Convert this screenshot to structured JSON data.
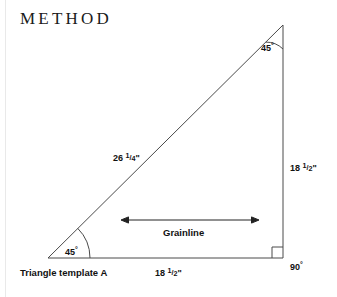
{
  "page": {
    "heading": "METHOD",
    "background_color": "#ffffff",
    "ink_color": "#111111",
    "line_color": "#4a4a4a"
  },
  "figure": {
    "name": "right-triangle-template-diagram",
    "shape": "right triangle",
    "vertices": {
      "apex_top_right": [
        283,
        25
      ],
      "corner_bottom_left": [
        48,
        258
      ],
      "corner_bottom_right": [
        283,
        258
      ]
    },
    "angles": [
      {
        "id": "angle-top-right",
        "value": "45",
        "unit": "°",
        "marker": "arc"
      },
      {
        "id": "angle-bottom-left",
        "value": "45",
        "unit": "°",
        "marker": "arc"
      },
      {
        "id": "angle-bottom-right",
        "value": "90",
        "unit": "°",
        "marker": "square"
      }
    ],
    "dimensions": [
      {
        "id": "hypotenuse",
        "whole": "26",
        "fraction_num": "1",
        "fraction_den": "4",
        "unit": "\""
      },
      {
        "id": "vertical-leg",
        "whole": "18",
        "fraction_num": "1",
        "fraction_den": "2",
        "unit": "\""
      },
      {
        "id": "base-leg",
        "whole": "18",
        "fraction_num": "1",
        "fraction_den": "2",
        "unit": "\""
      }
    ],
    "grainline": {
      "label": "Grainline",
      "arrow": "double-headed",
      "from": [
        122,
        220
      ],
      "to": [
        258,
        220
      ]
    },
    "caption": "Triangle template A"
  }
}
